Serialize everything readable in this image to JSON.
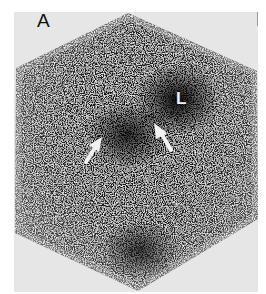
{
  "figure": {
    "panel_label": "A",
    "annotations": {
      "region_label": "L",
      "arrows": [
        {
          "name": "left-arrow",
          "direction": "up-right",
          "tail": [
            86,
            162
          ],
          "tip": [
            101,
            138
          ]
        },
        {
          "name": "right-arrow",
          "direction": "up-left",
          "tail": [
            171,
            150
          ],
          "tip": [
            155,
            124
          ]
        }
      ]
    },
    "colors": {
      "background": "#e6e6e6",
      "particle": "#1a1a1a",
      "rim": "#6e6e6e",
      "annotation": "#f2f2f2"
    }
  }
}
